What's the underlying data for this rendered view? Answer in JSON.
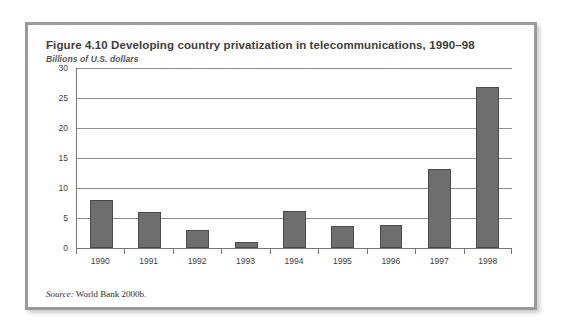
{
  "figure": {
    "title": "Figure 4.10  Developing country privatization in telecommunications, 1990–98",
    "subtitle": "Billions of U.S. dollars",
    "source_label": "Source:",
    "source_text": " World Bank 2000b."
  },
  "colors": {
    "bar_fill": "#6e6e6e",
    "bar_stroke": "#4a4a4a",
    "gridline": "#8e8e8e",
    "axis": "#777777",
    "frame": "#9a9a9a",
    "text": "#3d3d3d",
    "panel_bg": "#ffffff"
  },
  "chart_data": {
    "type": "bar",
    "title": "Figure 4.10  Developing country privatization in telecommunications, 1990–98",
    "subtitle": "Billions of U.S. dollars",
    "xlabel": "",
    "ylabel": "Billions of U.S. dollars",
    "categories": [
      "1990",
      "1991",
      "1992",
      "1993",
      "1994",
      "1995",
      "1996",
      "1997",
      "1998"
    ],
    "values": [
      8.0,
      6.0,
      3.0,
      1.0,
      6.1,
      3.7,
      3.9,
      13.1,
      26.8
    ],
    "ylim": [
      0,
      30
    ],
    "yticks": [
      0,
      5,
      10,
      15,
      20,
      25,
      30
    ],
    "ytick_labels": [
      "0",
      "5",
      "10",
      "15",
      "20",
      "25",
      "30"
    ],
    "grid": true,
    "legend": "none",
    "source": "Source: World Bank 2000b."
  }
}
